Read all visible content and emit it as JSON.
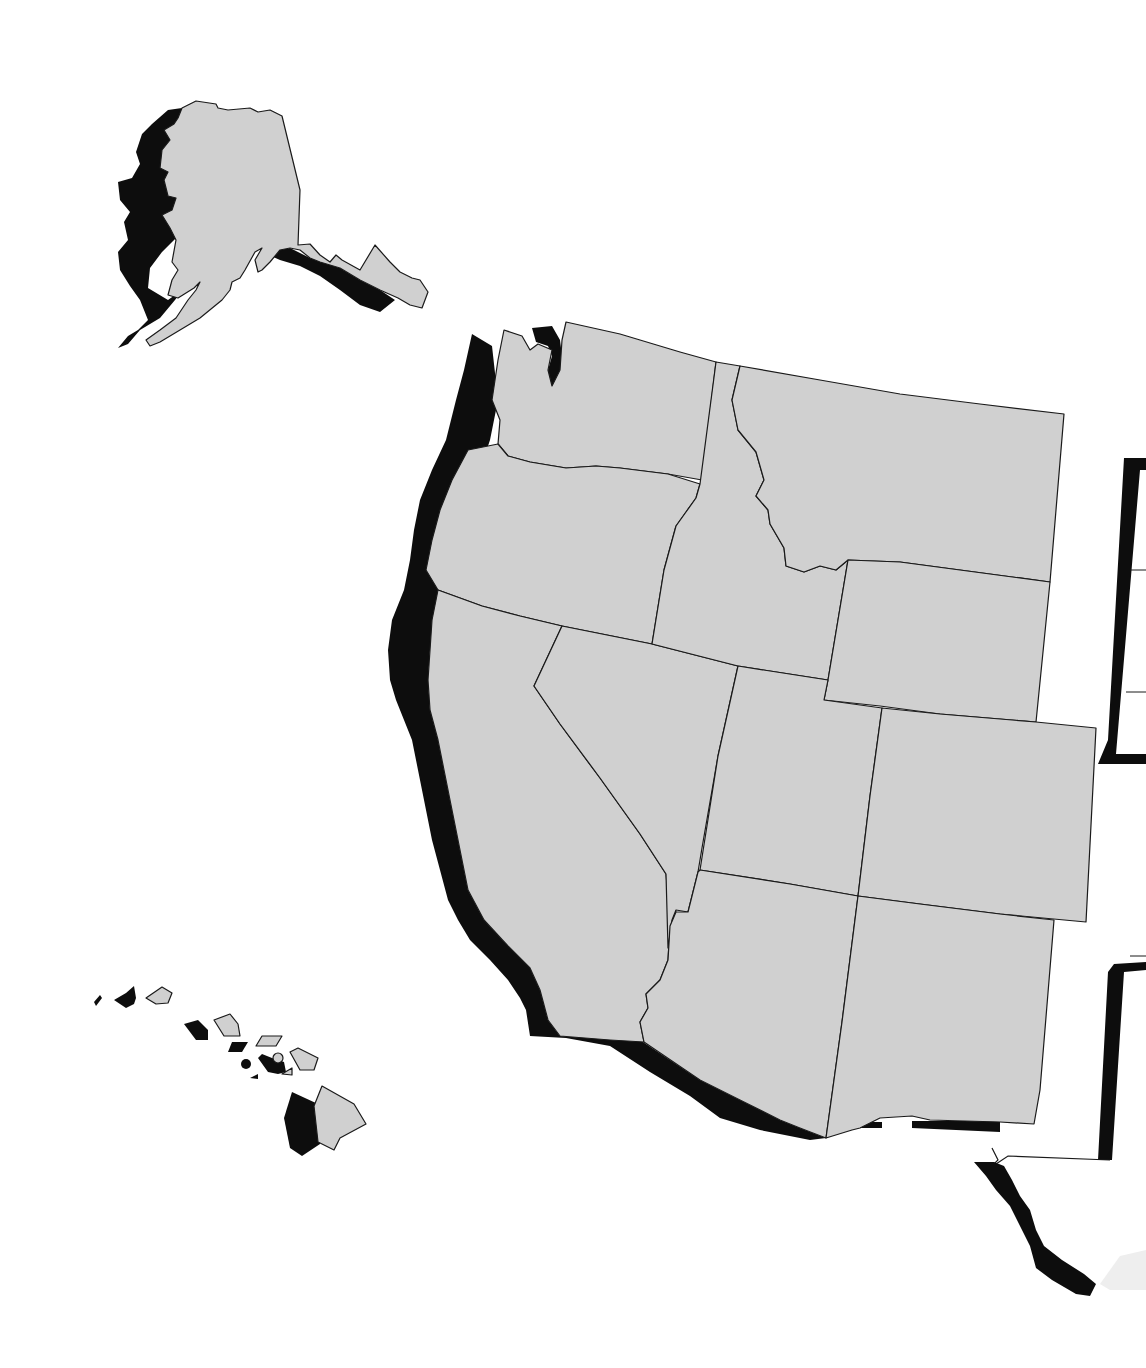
{
  "map": {
    "colors": {
      "land": "#d0d0d0",
      "shadow": "#0d0d0d",
      "border": "#1a1a1a",
      "background": "#ffffff"
    }
  }
}
